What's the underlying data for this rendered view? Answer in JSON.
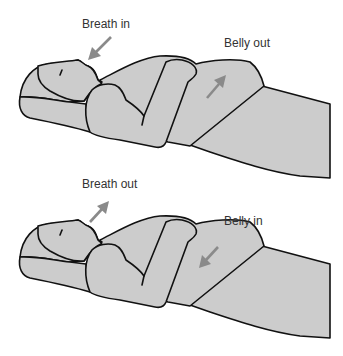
{
  "figure": {
    "panels": [
      {
        "id": "inhale",
        "breath_label": "Breath in",
        "belly_label": "Belly out",
        "breath_arrow_direction": "toward-mouth",
        "belly_arrow_direction": "up-out"
      },
      {
        "id": "exhale",
        "breath_label": "Breath out",
        "belly_label": "Belly in",
        "breath_arrow_direction": "away-from-mouth",
        "belly_arrow_direction": "down-in"
      }
    ],
    "caption": "",
    "colors": {
      "body_fill": "#cccccc",
      "outline": "#111111",
      "arrow": "#8a8a8a",
      "text": "#333333"
    }
  }
}
